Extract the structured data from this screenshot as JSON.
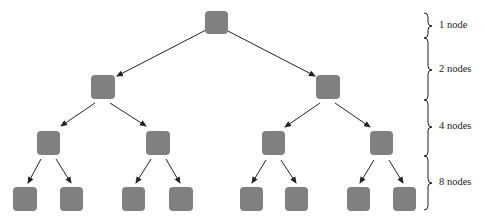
{
  "diagram": {
    "type": "binary-tree",
    "node_color": "#808080",
    "edge_color": "#222222",
    "levels": [
      {
        "label": "1 node",
        "count": 1
      },
      {
        "label": "2 nodes",
        "count": 2
      },
      {
        "label": "4 nodes",
        "count": 4
      },
      {
        "label": "8 nodes",
        "count": 8
      }
    ]
  }
}
